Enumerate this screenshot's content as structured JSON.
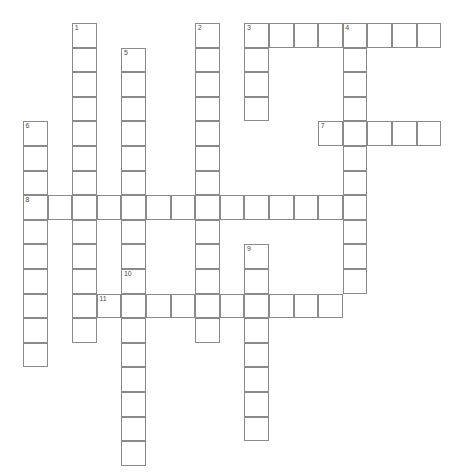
{
  "page": {
    "background_color": "#ffffff",
    "width": 475,
    "height": 472
  },
  "grid": {
    "cell_size": 24.6,
    "origin_x": 23,
    "origin_y": 23,
    "columns": 18,
    "rows": 18,
    "cell_fill_color": "#ffffff",
    "cell_border_color": "#8a8a8a",
    "number_color": "#4a4a4a",
    "letter_color": "#111111",
    "state": "empty"
  },
  "entries": {
    "across": [
      {
        "number": "3",
        "row": 0,
        "col": 9,
        "length": 8
      },
      {
        "number": "7",
        "row": 4,
        "col": 12,
        "length": 5
      },
      {
        "number": "8",
        "row": 7,
        "col": 0,
        "length": 14
      },
      {
        "number": "11",
        "row": 11,
        "col": 3,
        "length": 10
      }
    ],
    "down": [
      {
        "number": "1",
        "row": 0,
        "col": 2,
        "length": 13
      },
      {
        "number": "2",
        "row": 0,
        "col": 7,
        "length": 12
      },
      {
        "number": "4",
        "row": 0,
        "col": 13,
        "length": 11
      },
      {
        "number": "5",
        "row": 1,
        "col": 4,
        "length": 7
      },
      {
        "number": "6",
        "row": 4,
        "col": 0,
        "length": 10
      },
      {
        "number": "9",
        "row": 9,
        "col": 9,
        "length": 8
      },
      {
        "number": "10",
        "row": 10,
        "col": 4,
        "length": 8
      }
    ]
  },
  "cells": [
    {
      "row": 0,
      "col": 2,
      "number": "1",
      "letter": ""
    },
    {
      "row": 1,
      "col": 2,
      "number": "",
      "letter": ""
    },
    {
      "row": 2,
      "col": 2,
      "number": "",
      "letter": ""
    },
    {
      "row": 3,
      "col": 2,
      "number": "",
      "letter": ""
    },
    {
      "row": 4,
      "col": 2,
      "number": "",
      "letter": ""
    },
    {
      "row": 5,
      "col": 2,
      "number": "",
      "letter": ""
    },
    {
      "row": 6,
      "col": 2,
      "number": "",
      "letter": ""
    },
    {
      "row": 7,
      "col": 2,
      "number": "",
      "letter": ""
    },
    {
      "row": 8,
      "col": 2,
      "number": "",
      "letter": ""
    },
    {
      "row": 9,
      "col": 2,
      "number": "",
      "letter": ""
    },
    {
      "row": 10,
      "col": 2,
      "number": "",
      "letter": ""
    },
    {
      "row": 11,
      "col": 2,
      "number": "",
      "letter": ""
    },
    {
      "row": 12,
      "col": 2,
      "number": "",
      "letter": ""
    },
    {
      "row": 1,
      "col": 4,
      "number": "5",
      "letter": ""
    },
    {
      "row": 2,
      "col": 4,
      "number": "",
      "letter": ""
    },
    {
      "row": 3,
      "col": 4,
      "number": "",
      "letter": ""
    },
    {
      "row": 4,
      "col": 4,
      "number": "",
      "letter": ""
    },
    {
      "row": 5,
      "col": 4,
      "number": "",
      "letter": ""
    },
    {
      "row": 6,
      "col": 4,
      "number": "",
      "letter": ""
    },
    {
      "row": 7,
      "col": 4,
      "number": "",
      "letter": ""
    },
    {
      "row": 0,
      "col": 7,
      "number": "2",
      "letter": ""
    },
    {
      "row": 1,
      "col": 7,
      "number": "",
      "letter": ""
    },
    {
      "row": 2,
      "col": 7,
      "number": "",
      "letter": ""
    },
    {
      "row": 3,
      "col": 7,
      "number": "",
      "letter": ""
    },
    {
      "row": 4,
      "col": 7,
      "number": "",
      "letter": ""
    },
    {
      "row": 5,
      "col": 7,
      "number": "",
      "letter": ""
    },
    {
      "row": 6,
      "col": 7,
      "number": "",
      "letter": ""
    },
    {
      "row": 7,
      "col": 7,
      "number": "",
      "letter": ""
    },
    {
      "row": 8,
      "col": 7,
      "number": "",
      "letter": ""
    },
    {
      "row": 9,
      "col": 7,
      "number": "",
      "letter": ""
    },
    {
      "row": 10,
      "col": 7,
      "number": "",
      "letter": ""
    },
    {
      "row": 11,
      "col": 7,
      "number": "",
      "letter": ""
    },
    {
      "row": 0,
      "col": 9,
      "number": "3",
      "letter": ""
    },
    {
      "row": 0,
      "col": 10,
      "number": "",
      "letter": ""
    },
    {
      "row": 0,
      "col": 11,
      "number": "",
      "letter": ""
    },
    {
      "row": 0,
      "col": 12,
      "number": "",
      "letter": ""
    },
    {
      "row": 0,
      "col": 13,
      "number": "4",
      "letter": ""
    },
    {
      "row": 0,
      "col": 14,
      "number": "",
      "letter": ""
    },
    {
      "row": 0,
      "col": 15,
      "number": "",
      "letter": ""
    },
    {
      "row": 0,
      "col": 16,
      "number": "",
      "letter": ""
    },
    {
      "row": 1,
      "col": 9,
      "number": "",
      "letter": ""
    },
    {
      "row": 2,
      "col": 9,
      "number": "",
      "letter": ""
    },
    {
      "row": 3,
      "col": 9,
      "number": "",
      "letter": ""
    },
    {
      "row": 1,
      "col": 13,
      "number": "",
      "letter": ""
    },
    {
      "row": 2,
      "col": 13,
      "number": "",
      "letter": ""
    },
    {
      "row": 3,
      "col": 13,
      "number": "",
      "letter": ""
    },
    {
      "row": 4,
      "col": 13,
      "number": "",
      "letter": ""
    },
    {
      "row": 5,
      "col": 13,
      "number": "",
      "letter": ""
    },
    {
      "row": 6,
      "col": 13,
      "number": "",
      "letter": ""
    },
    {
      "row": 7,
      "col": 13,
      "number": "",
      "letter": ""
    },
    {
      "row": 8,
      "col": 13,
      "number": "",
      "letter": ""
    },
    {
      "row": 9,
      "col": 13,
      "number": "",
      "letter": ""
    },
    {
      "row": 10,
      "col": 13,
      "number": "",
      "letter": ""
    },
    {
      "row": 4,
      "col": 12,
      "number": "7",
      "letter": ""
    },
    {
      "row": 4,
      "col": 14,
      "number": "",
      "letter": ""
    },
    {
      "row": 4,
      "col": 15,
      "number": "",
      "letter": ""
    },
    {
      "row": 4,
      "col": 16,
      "number": "",
      "letter": ""
    },
    {
      "row": 4,
      "col": 0,
      "number": "6",
      "letter": ""
    },
    {
      "row": 5,
      "col": 0,
      "number": "",
      "letter": ""
    },
    {
      "row": 6,
      "col": 0,
      "number": "",
      "letter": ""
    },
    {
      "row": 8,
      "col": 0,
      "number": "",
      "letter": ""
    },
    {
      "row": 9,
      "col": 0,
      "number": "",
      "letter": ""
    },
    {
      "row": 10,
      "col": 0,
      "number": "",
      "letter": ""
    },
    {
      "row": 11,
      "col": 0,
      "number": "",
      "letter": ""
    },
    {
      "row": 12,
      "col": 0,
      "number": "",
      "letter": ""
    },
    {
      "row": 13,
      "col": 0,
      "number": "",
      "letter": ""
    },
    {
      "row": 7,
      "col": 0,
      "number": "8",
      "letter": ""
    },
    {
      "row": 7,
      "col": 1,
      "number": "",
      "letter": ""
    },
    {
      "row": 7,
      "col": 3,
      "number": "",
      "letter": ""
    },
    {
      "row": 7,
      "col": 5,
      "number": "",
      "letter": ""
    },
    {
      "row": 7,
      "col": 6,
      "number": "",
      "letter": ""
    },
    {
      "row": 7,
      "col": 8,
      "number": "",
      "letter": ""
    },
    {
      "row": 7,
      "col": 9,
      "number": "",
      "letter": ""
    },
    {
      "row": 7,
      "col": 10,
      "number": "",
      "letter": ""
    },
    {
      "row": 7,
      "col": 11,
      "number": "",
      "letter": ""
    },
    {
      "row": 7,
      "col": 12,
      "number": "",
      "letter": ""
    },
    {
      "row": 9,
      "col": 9,
      "number": "9",
      "letter": ""
    },
    {
      "row": 10,
      "col": 9,
      "number": "",
      "letter": ""
    },
    {
      "row": 11,
      "col": 9,
      "number": "",
      "letter": ""
    },
    {
      "row": 12,
      "col": 9,
      "number": "",
      "letter": ""
    },
    {
      "row": 13,
      "col": 9,
      "number": "",
      "letter": ""
    },
    {
      "row": 14,
      "col": 9,
      "number": "",
      "letter": ""
    },
    {
      "row": 15,
      "col": 9,
      "number": "",
      "letter": ""
    },
    {
      "row": 16,
      "col": 9,
      "number": "",
      "letter": ""
    },
    {
      "row": 10,
      "col": 4,
      "number": "10",
      "letter": ""
    },
    {
      "row": 12,
      "col": 4,
      "number": "",
      "letter": ""
    },
    {
      "row": 13,
      "col": 4,
      "number": "",
      "letter": ""
    },
    {
      "row": 14,
      "col": 4,
      "number": "",
      "letter": ""
    },
    {
      "row": 15,
      "col": 4,
      "number": "",
      "letter": ""
    },
    {
      "row": 16,
      "col": 4,
      "number": "",
      "letter": ""
    },
    {
      "row": 17,
      "col": 4,
      "number": "",
      "letter": ""
    },
    {
      "row": 11,
      "col": 3,
      "number": "11",
      "letter": ""
    },
    {
      "row": 11,
      "col": 4,
      "number": "",
      "letter": ""
    },
    {
      "row": 11,
      "col": 5,
      "number": "",
      "letter": ""
    },
    {
      "row": 11,
      "col": 6,
      "number": "",
      "letter": ""
    },
    {
      "row": 11,
      "col": 8,
      "number": "",
      "letter": ""
    },
    {
      "row": 11,
      "col": 10,
      "number": "",
      "letter": ""
    },
    {
      "row": 11,
      "col": 11,
      "number": "",
      "letter": ""
    },
    {
      "row": 11,
      "col": 12,
      "number": "",
      "letter": ""
    },
    {
      "row": 8,
      "col": 4,
      "number": "",
      "letter": ""
    },
    {
      "row": 9,
      "col": 4,
      "number": "",
      "letter": ""
    },
    {
      "row": 8,
      "col": 2,
      "number": "",
      "letter": ""
    },
    {
      "row": 12,
      "col": 7,
      "number": "",
      "letter": ""
    }
  ]
}
